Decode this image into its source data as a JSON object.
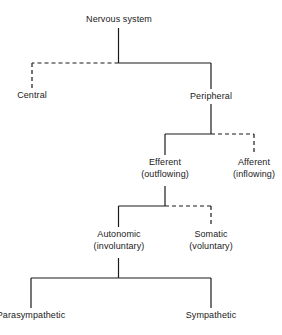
{
  "diagram": {
    "line_color": "#1a1a1a",
    "text_color": "#1a1a1a",
    "background_color": "#ffffff",
    "nodes": {
      "root": {
        "label": "Nervous system",
        "sublabel": "",
        "x": 119,
        "y": 22,
        "branch_style": "solid"
      },
      "central": {
        "label": "Central",
        "sublabel": "",
        "x": 32,
        "y": 98,
        "branch_style": "dashed"
      },
      "peripheral": {
        "label": "Peripheral",
        "sublabel": "",
        "x": 211,
        "y": 99,
        "branch_style": "solid"
      },
      "efferent": {
        "label": "Efferent",
        "sublabel": "(outflowing)",
        "x": 165,
        "y": 165,
        "branch_style": "solid"
      },
      "afferent": {
        "label": "Afferent",
        "sublabel": "(inflowing)",
        "x": 254,
        "y": 165,
        "branch_style": "dashed"
      },
      "autonomic": {
        "label": "Autonomic",
        "sublabel": "(involuntary)",
        "x": 119,
        "y": 237,
        "branch_style": "solid"
      },
      "somatic": {
        "label": "Somatic",
        "sublabel": "(voluntary)",
        "x": 211,
        "y": 237,
        "branch_style": "dashed"
      },
      "parasympathetic": {
        "label": "Parasympathetic",
        "sublabel": "",
        "x": 31,
        "y": 318,
        "branch_style": "solid"
      },
      "sympathetic": {
        "label": "Sympathetic",
        "sublabel": "",
        "x": 211,
        "y": 318,
        "branch_style": "solid"
      }
    },
    "edges": [
      {
        "from": "root",
        "to": "central",
        "style": "dashed"
      },
      {
        "from": "root",
        "to": "peripheral",
        "style": "solid"
      },
      {
        "from": "peripheral",
        "to": "efferent",
        "style": "solid"
      },
      {
        "from": "peripheral",
        "to": "afferent",
        "style": "dashed"
      },
      {
        "from": "efferent",
        "to": "autonomic",
        "style": "solid"
      },
      {
        "from": "efferent",
        "to": "somatic",
        "style": "dashed"
      },
      {
        "from": "autonomic",
        "to": "parasympathetic",
        "style": "solid"
      },
      {
        "from": "autonomic",
        "to": "sympathetic",
        "style": "solid"
      }
    ]
  }
}
